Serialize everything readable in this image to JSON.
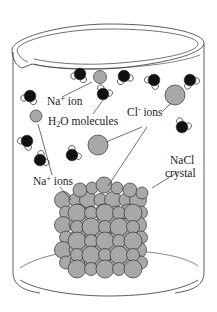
{
  "figure": {
    "labels": {
      "na_ion_top": {
        "base": "Na",
        "sup": "+",
        "rest": " ion"
      },
      "h2o": {
        "pre": "H",
        "sub": "2",
        "rest": "O molecules"
      },
      "cl_ions": {
        "base": "Cl",
        "sup": "-",
        "rest": " ions"
      },
      "na_ions": {
        "base": "Na",
        "sup": "+",
        "rest": " ions"
      },
      "nacl_line1": "NaCl",
      "nacl_line2": "crystal"
    },
    "colors": {
      "ion": "#a8a8a8",
      "oxygen": "#111111",
      "hydrogen": "#ffffff",
      "outline": "#333333"
    }
  }
}
